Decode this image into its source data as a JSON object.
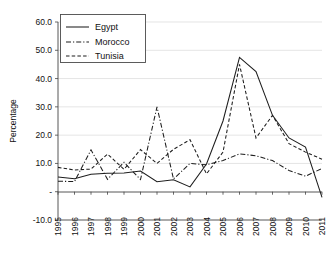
{
  "chart_data": {
    "type": "line",
    "title": "",
    "xlabel": "",
    "ylabel": "Percentage",
    "categories": [
      "1995",
      "1996",
      "1997",
      "1998",
      "1999",
      "2000",
      "2001",
      "2002",
      "2003",
      "2004",
      "2005",
      "2006",
      "2007",
      "2008",
      "2009",
      "2010",
      "2011"
    ],
    "xlim": [
      1995,
      2011
    ],
    "ylim": [
      -10.0,
      60.0
    ],
    "yticks": [
      "60.0",
      "50.0",
      "40.0",
      "30.0",
      "20.0",
      "10.0",
      "-",
      "-10.0"
    ],
    "ytick_values": [
      60.0,
      50.0,
      40.0,
      30.0,
      20.0,
      10.0,
      0.0,
      -10.0
    ],
    "grid": true,
    "legend_position": "top-left",
    "series": [
      {
        "name": "Egypt",
        "style": "solid",
        "values": [
          5.2,
          4.6,
          6.2,
          6.5,
          6.6,
          7.3,
          3.5,
          4.2,
          1.7,
          9.8,
          25.0,
          47.5,
          42.5,
          27.0,
          19.0,
          15.8,
          -2.0
        ]
      },
      {
        "name": "Morocco",
        "style": "dash-dot",
        "values": [
          3.7,
          3.6,
          14.8,
          4.4,
          10.4,
          4.3,
          30.0,
          4.5,
          10.0,
          9.5,
          11.0,
          13.4,
          12.7,
          11.0,
          7.5,
          5.5,
          8.2
        ]
      },
      {
        "name": "Tunisia",
        "style": "dashed",
        "values": [
          8.6,
          7.7,
          8.0,
          13.3,
          7.9,
          14.9,
          10.0,
          15.0,
          18.4,
          6.3,
          14.0,
          45.0,
          19.0,
          27.0,
          17.0,
          14.0,
          11.5
        ]
      }
    ]
  },
  "legend": {
    "items": [
      {
        "label": "Egypt"
      },
      {
        "label": "Morocco"
      },
      {
        "label": "Tunisia"
      }
    ]
  }
}
